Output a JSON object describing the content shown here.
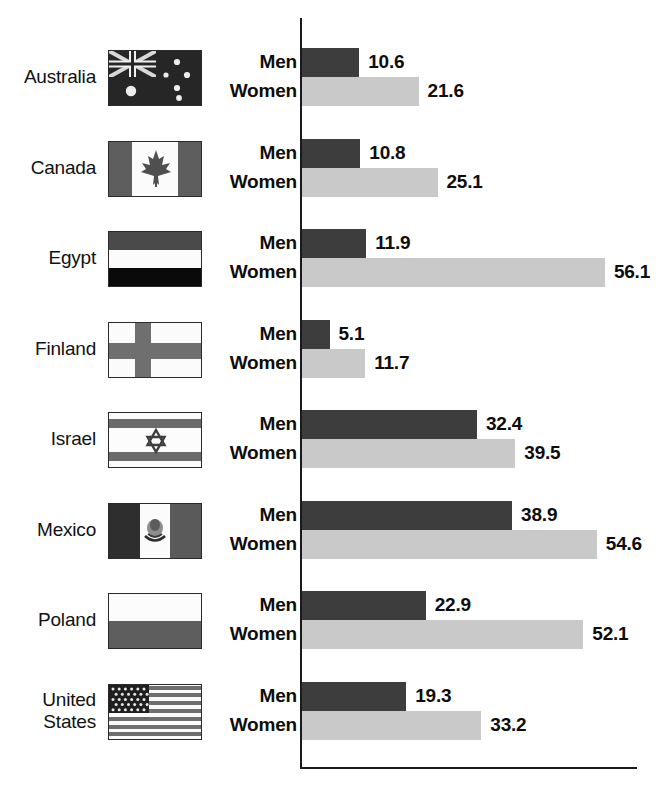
{
  "chart_data": {
    "type": "bar",
    "orientation": "horizontal",
    "title": "",
    "subtitle": "",
    "xlabel": "",
    "ylabel": "",
    "categories": [
      "Australia",
      "Canada",
      "Egypt",
      "Finland",
      "Israel",
      "Mexico",
      "Poland",
      "United States"
    ],
    "series": [
      {
        "name": "Men",
        "color": "#3d3d3d",
        "values": [
          10.6,
          10.8,
          11.9,
          5.1,
          32.4,
          38.9,
          22.9,
          19.3
        ]
      },
      {
        "name": "Women",
        "color": "#c9c9c9",
        "values": [
          21.6,
          25.1,
          56.1,
          11.7,
          39.5,
          54.6,
          52.1,
          33.2
        ]
      }
    ],
    "xlim": [
      0,
      62.5
    ],
    "grid": false,
    "legend": "none",
    "axis_ticks": [],
    "value_labels_shown": true
  },
  "axis": {
    "y_axis_name": "category-axis",
    "x_axis_name": "value-axis"
  },
  "series_labels": {
    "men": "Men",
    "women": "Women"
  },
  "rows": [
    {
      "country": "Australia",
      "country_lines": [
        "Australia"
      ],
      "flag": "flag-australia",
      "men_label": "Men",
      "women_label": "Women",
      "men_value": "10.6",
      "women_value": "21.6"
    },
    {
      "country": "Canada",
      "country_lines": [
        "Canada"
      ],
      "flag": "flag-canada",
      "men_label": "Men",
      "women_label": "Women",
      "men_value": "10.8",
      "women_value": "25.1"
    },
    {
      "country": "Egypt",
      "country_lines": [
        "Egypt"
      ],
      "flag": "flag-egypt",
      "men_label": "Men",
      "women_label": "Women",
      "men_value": "11.9",
      "women_value": "56.1"
    },
    {
      "country": "Finland",
      "country_lines": [
        "Finland"
      ],
      "flag": "flag-finland",
      "men_label": "Men",
      "women_label": "Women",
      "men_value": "5.1",
      "women_value": "11.7"
    },
    {
      "country": "Israel",
      "country_lines": [
        "Israel"
      ],
      "flag": "flag-israel",
      "men_label": "Men",
      "women_label": "Women",
      "men_value": "32.4",
      "women_value": "39.5"
    },
    {
      "country": "Mexico",
      "country_lines": [
        "Mexico"
      ],
      "flag": "flag-mexico",
      "men_label": "Men",
      "women_label": "Women",
      "men_value": "38.9",
      "women_value": "54.6"
    },
    {
      "country": "Poland",
      "country_lines": [
        "Poland"
      ],
      "flag": "flag-poland",
      "men_label": "Men",
      "women_label": "Women",
      "men_value": "22.9",
      "women_value": "52.1"
    },
    {
      "country": "United States",
      "country_lines": [
        "United",
        "States"
      ],
      "flag": "flag-united-states",
      "men_label": "Men",
      "women_label": "Women",
      "men_value": "19.3",
      "women_value": "33.2"
    }
  ],
  "colors": {
    "bar_men": "#3d3d3d",
    "bar_women": "#c9c9c9",
    "axis": "#1a1a1a",
    "text": "#0d0d0d",
    "background": "#ffffff"
  }
}
